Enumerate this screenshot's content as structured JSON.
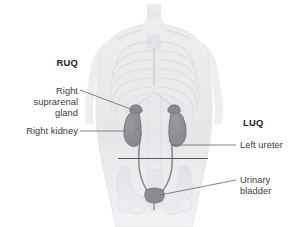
{
  "figure": {
    "background_color": "#ffffff"
  },
  "quadrant_labels": [
    {
      "id": "ruq",
      "text": "RUQ",
      "side": "left",
      "bold": true
    },
    {
      "id": "luq",
      "text": "LUQ",
      "side": "right",
      "bold": true
    }
  ],
  "organ_labels": [
    {
      "id": "right-suprarenal-gland",
      "text": "Right\nsuprarenal\ngland",
      "side": "left",
      "leader": "diagonal"
    },
    {
      "id": "right-kidney",
      "text": "Right kidney",
      "side": "left",
      "leader": "horizontal"
    },
    {
      "id": "left-ureter",
      "text": "Left ureter",
      "side": "right",
      "leader": "horizontal"
    },
    {
      "id": "urinary-bladder",
      "text": "Urinary\nbladder",
      "side": "right",
      "leader": "diagonal"
    }
  ],
  "colors": {
    "text": "#3b3b3d",
    "text_bold": "#1d1d1f",
    "leader_line": "#6e6e73",
    "divider_line": "#5a5a5e",
    "organ_fill": "#8e8e93",
    "organ_stroke": "#6b6b70",
    "body_ghost": "#e9e9ec",
    "skeleton_ghost": "#dedee2"
  },
  "illustration": {
    "name": "ghosted-male-torso-with-urinary-tract",
    "organs": [
      "right kidney",
      "left kidney",
      "right suprarenal gland",
      "left suprarenal gland",
      "right ureter",
      "left ureter",
      "urinary bladder"
    ],
    "divider_lines": 2
  }
}
